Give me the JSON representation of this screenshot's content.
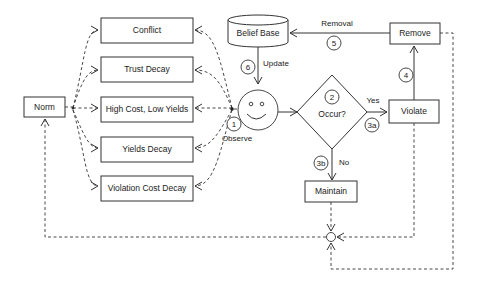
{
  "diagram": {
    "nodes": {
      "norm": "Norm",
      "conflict": "Conflict",
      "trust_decay": "Trust Decay",
      "high_cost": "High Cost, Low Yields",
      "yields_decay": "Yields Decay",
      "violation_cost_decay": "Violation Cost Decay",
      "belief_base": "Belief Base",
      "decision": "Occur?",
      "violate": "Violate",
      "remove": "Remove",
      "maintain": "Maintain"
    },
    "edge_labels": {
      "observe": "Observe",
      "update": "Update",
      "removal": "Removal",
      "yes": "Yes",
      "no": "No"
    },
    "steps": {
      "s1": "1",
      "s2": "2",
      "s3a": "3a",
      "s3b": "3b",
      "s4": "4",
      "s5": "5",
      "s6": "6"
    }
  }
}
